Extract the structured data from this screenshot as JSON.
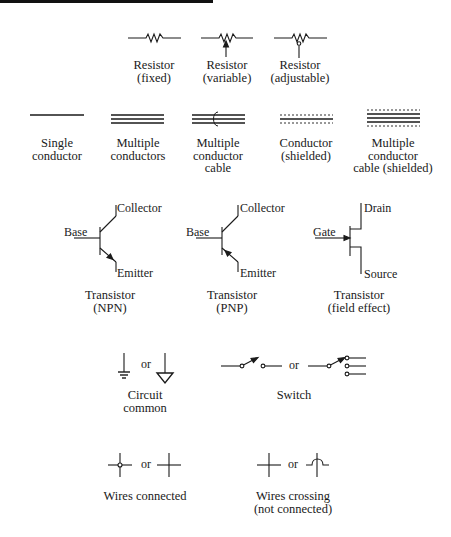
{
  "figure": {
    "title_bar": "top-rule",
    "rows": {
      "resistors": [
        {
          "id": "resistor-fixed",
          "label_lines": [
            "Resistor",
            "(fixed)"
          ]
        },
        {
          "id": "resistor-variable",
          "label_lines": [
            "Resistor",
            "(variable)"
          ]
        },
        {
          "id": "resistor-adjustable",
          "label_lines": [
            "Resistor",
            "(adjustable)"
          ]
        }
      ],
      "conductors": [
        {
          "id": "single-conductor",
          "label_lines": [
            "Single",
            "conductor"
          ]
        },
        {
          "id": "multiple-conductors",
          "label_lines": [
            "Multiple",
            "conductors"
          ]
        },
        {
          "id": "multiple-conductor-cable",
          "label_lines": [
            "Multiple",
            "conductor",
            "cable"
          ]
        },
        {
          "id": "conductor-shielded",
          "label_lines": [
            "Conductor",
            "(shielded)"
          ]
        },
        {
          "id": "multiple-conductor-cable-shielded",
          "label_lines": [
            "Multiple",
            "conductor",
            "cable (shielded)"
          ]
        }
      ],
      "transistors": [
        {
          "id": "transistor-npn",
          "pins": {
            "top": "Collector",
            "left": "Base",
            "bottom": "Emitter"
          },
          "label_lines": [
            "Transistor",
            "(NPN)"
          ]
        },
        {
          "id": "transistor-pnp",
          "pins": {
            "top": "Collector",
            "left": "Base",
            "bottom": "Emitter"
          },
          "label_lines": [
            "Transistor",
            "(PNP)"
          ]
        },
        {
          "id": "transistor-fet",
          "pins": {
            "top": "Drain",
            "left": "Gate",
            "bottom": "Source"
          },
          "label_lines": [
            "Transistor",
            "(field effect)"
          ]
        }
      ],
      "common_switch": [
        {
          "id": "circuit-common",
          "or_text": "or",
          "label_lines": [
            "Circuit",
            "common"
          ]
        },
        {
          "id": "switch",
          "or_text": "or",
          "label_lines": [
            "Switch"
          ]
        }
      ],
      "wires": [
        {
          "id": "wires-connected",
          "or_text": "or",
          "label_lines": [
            "Wires connected"
          ]
        },
        {
          "id": "wires-crossing",
          "or_text": "or",
          "label_lines": [
            "Wires crossing",
            "(not connected)"
          ]
        }
      ]
    }
  }
}
